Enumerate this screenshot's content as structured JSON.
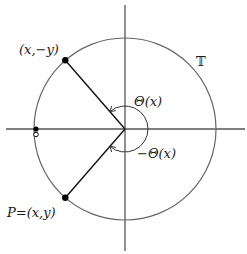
{
  "figure": {
    "circle_label": "𝕋",
    "point_upper_label": "(x,−y)",
    "point_lower_label": "P=(x,y)",
    "angle_positive_label": "Θ(x)",
    "angle_negative_label": "−Θ(x)",
    "ray_angle_degrees": 131,
    "colors": {
      "axis": "#555555",
      "circle": "#555555",
      "ray": "#111111",
      "point": "#000000"
    }
  }
}
